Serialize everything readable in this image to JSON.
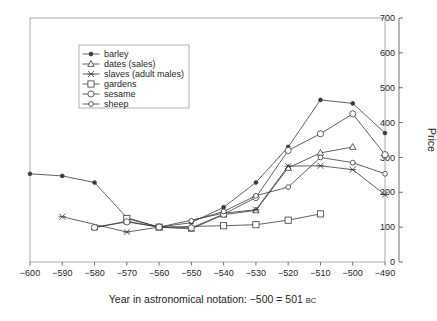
{
  "chart_data": {
    "type": "line",
    "title": "",
    "xlabel": "Year in astronomical notation: −500 = 501 BC",
    "xlabel_main": "Year in astronomical notation: −500 = 501",
    "xlabel_suffix": "BC",
    "ylabel": "Price",
    "xlim": [
      -600,
      -490
    ],
    "ylim": [
      0,
      700
    ],
    "grid": false,
    "legend_position": "top-left-inside",
    "x_ticks": [
      -600,
      -590,
      -580,
      -570,
      -560,
      -550,
      -540,
      -530,
      -520,
      -510,
      -500,
      -490
    ],
    "x_tick_labels": [
      "−600",
      "−590",
      "−580",
      "−570",
      "−560",
      "−550",
      "−540",
      "−530",
      "−520",
      "−510",
      "−500",
      "−490"
    ],
    "y_ticks": [
      0,
      100,
      200,
      300,
      400,
      500,
      600,
      700
    ],
    "y_tick_labels": [
      "0",
      "100",
      "200",
      "300",
      "400",
      "500",
      "600",
      "700"
    ],
    "y_axis_side": "right",
    "series": [
      {
        "name": "barley",
        "marker": "filled-dot",
        "color": "#3a3a3a",
        "x": [
          -600,
          -590,
          -580,
          -570,
          -560,
          -550,
          -540,
          -530,
          -520,
          -510,
          -500,
          -490
        ],
        "values": [
          253,
          247,
          228,
          127,
          100,
          113,
          157,
          228,
          330,
          465,
          455,
          370
        ]
      },
      {
        "name": "dates (sales)",
        "marker": "triangle",
        "color": "#3a3a3a",
        "x": [
          -580,
          -570,
          -560,
          -550,
          -540,
          -530,
          -520,
          -510,
          -500
        ],
        "values": [
          99,
          117,
          100,
          95,
          136,
          148,
          270,
          313,
          330
        ]
      },
      {
        "name": "slaves (adult males)",
        "marker": "x",
        "color": "#3a3a3a",
        "x": [
          -590,
          -570,
          -560,
          -540,
          -530,
          -520,
          -510,
          -500,
          -490
        ],
        "values": [
          130,
          86,
          100,
          140,
          150,
          275,
          276,
          265,
          193
        ]
      },
      {
        "name": "gardens",
        "marker": "square",
        "color": "#3a3a3a",
        "x": [
          -570,
          -560,
          -540,
          -530,
          -520,
          -510
        ],
        "values": [
          125,
          100,
          104,
          107,
          120,
          138
        ]
      },
      {
        "name": "sesame",
        "marker": "circle",
        "color": "#3a3a3a",
        "x": [
          -580,
          -570,
          -560,
          -550,
          -540,
          -530,
          -520,
          -510,
          -500,
          -490
        ],
        "values": [
          99,
          115,
          100,
          98,
          137,
          185,
          320,
          368,
          425,
          308
        ]
      },
      {
        "name": "sheep",
        "marker": "circle-small",
        "color": "#3a3a3a",
        "x": [
          -550,
          -540,
          -530,
          -520,
          -510,
          -500,
          -490
        ],
        "values": [
          118,
          145,
          190,
          215,
          300,
          285,
          253
        ]
      }
    ],
    "legend_entries": [
      {
        "label": "barley",
        "marker": "filled-dot"
      },
      {
        "label": "dates (sales)",
        "marker": "triangle"
      },
      {
        "label": "slaves (adult males)",
        "marker": "x"
      },
      {
        "label": "gardens",
        "marker": "square"
      },
      {
        "label": "sesame",
        "marker": "circle"
      },
      {
        "label": "sheep",
        "marker": "circle-small"
      }
    ]
  }
}
